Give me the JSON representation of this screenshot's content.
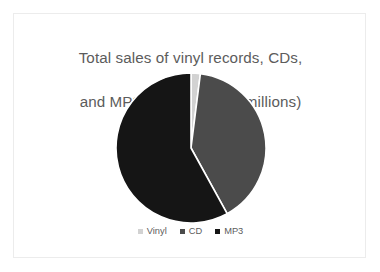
{
  "chart_data": {
    "type": "pie",
    "title": "Total sales of vinyl records, CDs,\nand MP3 downloads (in millions)",
    "title_line1": "Total sales of vinyl records, CDs,",
    "title_line2": "and MP3 downloads (in millions)",
    "categories": [
      "Vinyl",
      "CD",
      "MP3"
    ],
    "values": [
      2,
      40,
      58
    ],
    "units": "millions",
    "legend_position": "bottom",
    "start_angle_deg": 0,
    "direction": "clockwise",
    "grid": false,
    "xlabel": "",
    "ylabel": "",
    "slices": [
      {
        "label": "Vinyl",
        "value": 2,
        "percent": 2,
        "color": "#d2d2d2",
        "start_angle_deg": 0,
        "end_angle_deg": 7.2
      },
      {
        "label": "CD",
        "value": 40,
        "percent": 40,
        "color": "#4b4b4b",
        "start_angle_deg": 7.2,
        "end_angle_deg": 151.2
      },
      {
        "label": "MP3",
        "value": 58,
        "percent": 58,
        "color": "#151515",
        "start_angle_deg": 151.2,
        "end_angle_deg": 360
      }
    ]
  },
  "legend": {
    "items": [
      {
        "label": "Vinyl",
        "color": "#d2d2d2"
      },
      {
        "label": "CD",
        "color": "#4b4b4b"
      },
      {
        "label": "MP3",
        "color": "#151515"
      }
    ]
  },
  "colors": {
    "background": "#ffffff",
    "card_border": "#ececec",
    "title_text": "#5c5c5c",
    "legend_text": "#5c5c5c",
    "vinyl": "#d2d2d2",
    "cd": "#4b4b4b",
    "mp3": "#151515",
    "slice_separator": "#ffffff"
  }
}
